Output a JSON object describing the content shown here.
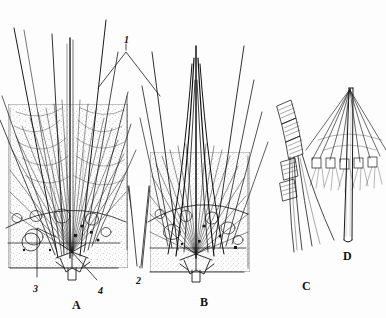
{
  "figure": {
    "type": "scientific-line-drawing-plate",
    "background_color": "#fdfdfd",
    "ink_color": "#1a1a1a",
    "panels": [
      {
        "id": "A",
        "label": "A",
        "label_x": 72,
        "label_y": 299,
        "description": "Dense radiating bristle/spicule tuft rising from a rosette base, shown in sectional view with stippled body wall"
      },
      {
        "id": "B",
        "label": "B",
        "label_x": 200,
        "label_y": 296,
        "description": "Converging dark filament bundle forming a tapering spire above a stippled basal plate with vesicles"
      },
      {
        "id": "C",
        "label": "C",
        "label_x": 302,
        "label_y": 280,
        "description": "Segmented jointed appendage with annulated segments and four trailing filaments"
      },
      {
        "id": "D",
        "label": "D",
        "label_x": 343,
        "label_y": 250,
        "description": "Slender shaft with umbrella-like crown of radiating filaments near the apex"
      }
    ],
    "callouts": [
      {
        "id": "1",
        "label": "1",
        "label_x": 124,
        "label_y": 35
      },
      {
        "id": "2",
        "label": "2",
        "label_x": 136,
        "label_y": 276
      },
      {
        "id": "3",
        "label": "3",
        "label_x": 33,
        "label_y": 284
      },
      {
        "id": "4",
        "label": "4",
        "label_x": 98,
        "label_y": 286
      }
    ]
  }
}
